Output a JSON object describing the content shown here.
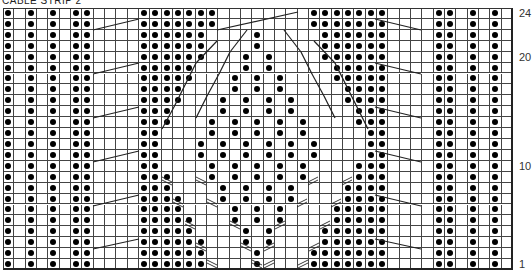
{
  "title": "CABLE STRIP 2",
  "chart": {
    "columns": 45,
    "rows": 24,
    "legend_note": "row strings listed top (row 24) to bottom (row 1); '.' = purl dot, ' ' = knit (blank)",
    "row_labels": [
      {
        "row": 24,
        "label": "24"
      },
      {
        "row": 20,
        "label": "20"
      },
      {
        "row": 10,
        "label": "10"
      },
      {
        "row": 1,
        "label": "1"
      }
    ],
    "pattern": [
      ". . . ..    .......        .......    .. . . .",
      ". . . ..    .......        .......    .. . . .",
      ". . . ..    ......    .     ......    .. . . .",
      ". . . ..    ......    .     ......    .. . . .",
      ". . . ..    ......   . .    ......    .. . . .",
      ". . . ..    .....    . .     .....    .. . . .",
      ". . . ..    .....   . . .    .....    .. . . .",
      ". . . ..    ....    . . .     ....    .. . . .",
      ". . . ..    ....   . . . .    ....    .. . . .",
      ". . . ..    ...    . . . .     ...    .. . . .",
      ". . . ..    ...   . . . . .    ...    .. . . .",
      ". . . ..    ..    . . . . .     ..    .. . . .",
      ". . . ..    ..   . . . . . .    ..    .. . . .",
      ". . . ..    ..   . . . . . .    ..    .. . . .",
      ". . . ..    ..    . . . . .    ...    .. . . .",
      ". . . ..    ...   . . . . .    ...    .. . . .",
      ". . . ..    ...    . . . .    ....    .. . . .",
      ". . . ..    ....   . . . .    ....    .. . . .",
      ". . . ..    ....    . . .    .....    .. . . .",
      ". . . ..    .....   . . .    .....    .. . . .",
      ". . . ..    .....    . .    ......    .. . . .",
      ". . . ..    ......   . .    ......    .. . . .",
      ". . . ..    ......    .    .......    .. . . .",
      ". . . ..    ......    .    .......    .. . . ."
    ]
  }
}
